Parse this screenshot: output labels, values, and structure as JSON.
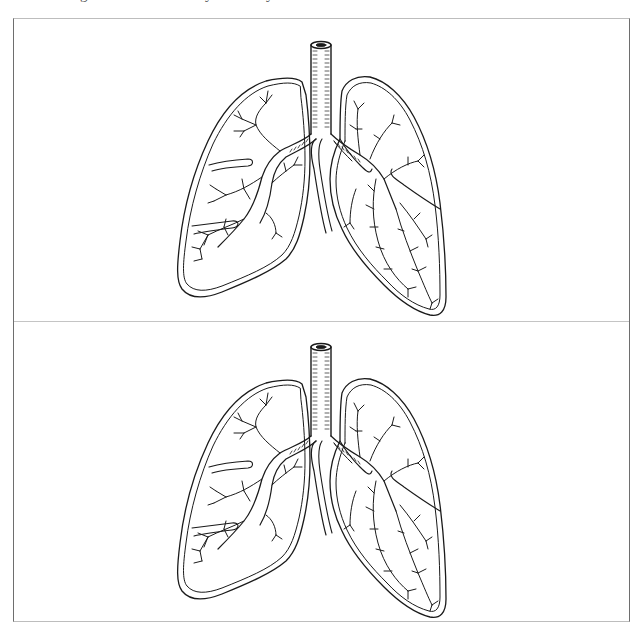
{
  "page": {
    "clipped_header_fragments": [
      "g",
      "y",
      "y"
    ]
  },
  "diagram": {
    "title": "",
    "panels": [
      {
        "id": "top",
        "subject": "human-lungs",
        "parts": [
          "trachea",
          "right-lung",
          "left-lung",
          "bronchi",
          "bronchioles",
          "lobe-fissures"
        ],
        "labels": []
      },
      {
        "id": "bottom",
        "subject": "human-lungs",
        "parts": [
          "trachea",
          "right-lung",
          "left-lung",
          "bronchi",
          "bronchioles",
          "lobe-fissures"
        ],
        "labels": []
      }
    ],
    "colors": {
      "ink": "#1a1a1a",
      "background": "#ffffff",
      "frame": "#6e6e6e",
      "divider": "#c4c4c4"
    }
  }
}
